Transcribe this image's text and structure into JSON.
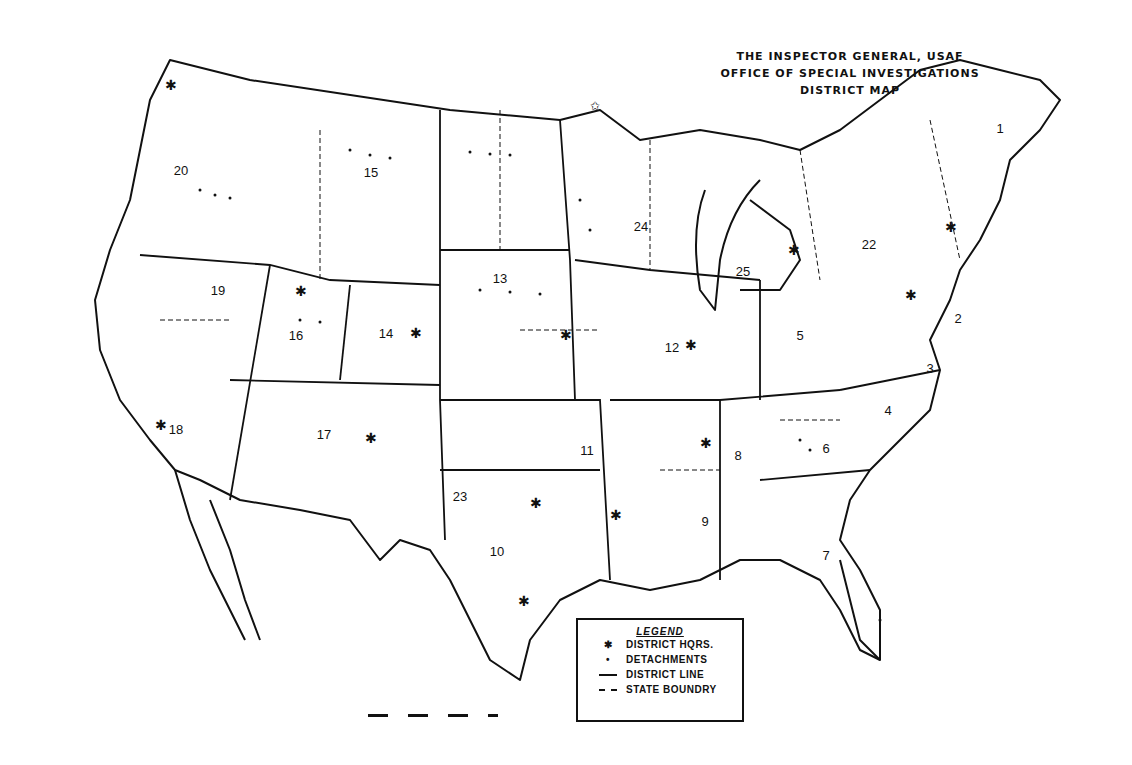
{
  "title": {
    "line1": "THE INSPECTOR GENERAL, USAF",
    "line2": "OFFICE OF SPECIAL INVESTIGATIONS",
    "line3": "DISTRICT MAP"
  },
  "legend": {
    "heading": "LEGEND",
    "items": [
      {
        "symbol": "star",
        "glyph": "✱",
        "label": "DISTRICT HQRS."
      },
      {
        "symbol": "dot",
        "glyph": "•",
        "label": "DETACHMENTS"
      },
      {
        "symbol": "solid-line",
        "label": "DISTRICT LINE"
      },
      {
        "symbol": "dashed-line",
        "label": "STATE BOUNDRY"
      }
    ]
  },
  "districts": [
    {
      "id": "1",
      "x": 1000,
      "y": 128
    },
    {
      "id": "2",
      "x": 958,
      "y": 318
    },
    {
      "id": "3",
      "x": 930,
      "y": 368
    },
    {
      "id": "4",
      "x": 888,
      "y": 410
    },
    {
      "id": "5",
      "x": 800,
      "y": 335
    },
    {
      "id": "6",
      "x": 826,
      "y": 448
    },
    {
      "id": "7",
      "x": 826,
      "y": 555
    },
    {
      "id": "8",
      "x": 738,
      "y": 455
    },
    {
      "id": "9",
      "x": 705,
      "y": 521
    },
    {
      "id": "10",
      "x": 497,
      "y": 551
    },
    {
      "id": "11",
      "x": 587,
      "y": 450
    },
    {
      "id": "12",
      "x": 672,
      "y": 347
    },
    {
      "id": "13",
      "x": 500,
      "y": 278
    },
    {
      "id": "14",
      "x": 386,
      "y": 333
    },
    {
      "id": "15",
      "x": 371,
      "y": 172
    },
    {
      "id": "16",
      "x": 296,
      "y": 335
    },
    {
      "id": "17",
      "x": 324,
      "y": 434
    },
    {
      "id": "18",
      "x": 176,
      "y": 429
    },
    {
      "id": "19",
      "x": 218,
      "y": 290
    },
    {
      "id": "20",
      "x": 181,
      "y": 170
    },
    {
      "id": "22",
      "x": 869,
      "y": 244
    },
    {
      "id": "23",
      "x": 460,
      "y": 496
    },
    {
      "id": "24",
      "x": 641,
      "y": 226
    },
    {
      "id": "25",
      "x": 743,
      "y": 271
    }
  ],
  "colors": {
    "ink": "#111111",
    "paper": "#ffffff"
  }
}
